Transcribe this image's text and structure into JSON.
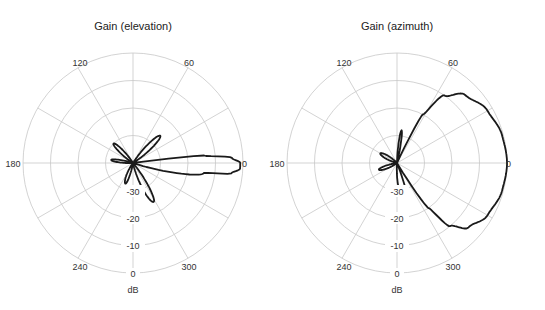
{
  "chart_data": [
    {
      "type": "polar-line",
      "title": "Gain (elevation)",
      "radial_label": "dB",
      "radial_ticks": [
        "-30",
        "-20",
        "-10",
        "0"
      ],
      "radial_range": [
        -40,
        0
      ],
      "angle_ticks": [
        "0",
        "60",
        "120",
        "180",
        "240",
        "300"
      ],
      "angle_spokes_deg": [
        0,
        30,
        60,
        90,
        120,
        150,
        180,
        210,
        240,
        270,
        300,
        330
      ],
      "grid": true,
      "series": [
        {
          "name": "elevation gain",
          "description": "Narrow main lobe at 0 deg (~-1 dB), side lobes near 45 deg, 135 deg, 170 deg, 250 deg and 295 deg at about -30 to -25 dB",
          "points_deg_db": [
            [
              0,
              -1
            ],
            [
              3,
              -4
            ],
            [
              6,
              -14
            ],
            [
              8,
              -40
            ],
            [
              30,
              -40
            ],
            [
              45,
              -26
            ],
            [
              60,
              -40
            ],
            [
              120,
              -40
            ],
            [
              135,
              -30
            ],
            [
              150,
              -40
            ],
            [
              160,
              -40
            ],
            [
              172,
              -32
            ],
            [
              185,
              -40
            ],
            [
              230,
              -40
            ],
            [
              250,
              -32
            ],
            [
              262,
              -40
            ],
            [
              280,
              -40
            ],
            [
              298,
              -24
            ],
            [
              312,
              -40
            ],
            [
              340,
              -40
            ],
            [
              352,
              -14
            ],
            [
              354,
              -4
            ],
            [
              357,
              -1
            ],
            [
              360,
              -1
            ]
          ]
        }
      ]
    },
    {
      "type": "polar-line",
      "title": "Gain (azimuth)",
      "radial_label": "dB",
      "radial_ticks": [
        "-30",
        "-20",
        "-10",
        "0"
      ],
      "radial_range": [
        -40,
        0
      ],
      "angle_ticks": [
        "0",
        "60",
        "120",
        "180",
        "240",
        "300"
      ],
      "angle_spokes_deg": [
        0,
        30,
        60,
        90,
        120,
        150,
        180,
        210,
        240,
        270,
        300,
        330
      ],
      "grid": true,
      "series": [
        {
          "name": "azimuth gain",
          "description": "Broad main lobe spanning roughly -60 to +65 deg with peak ~0 dB near 0 deg; small back lobes near 80, 150, 200 and 285 deg at about -30 dB",
          "points_deg_db": [
            [
              0,
              0
            ],
            [
              15,
              -0.5
            ],
            [
              30,
              -2
            ],
            [
              45,
              -5
            ],
            [
              55,
              -10
            ],
            [
              62,
              -20
            ],
            [
              66,
              -40
            ],
            [
              75,
              -40
            ],
            [
              82,
              -28
            ],
            [
              90,
              -40
            ],
            [
              130,
              -40
            ],
            [
              150,
              -33
            ],
            [
              170,
              -40
            ],
            [
              185,
              -40
            ],
            [
              200,
              -33
            ],
            [
              220,
              -40
            ],
            [
              265,
              -40
            ],
            [
              275,
              -31
            ],
            [
              288,
              -30
            ],
            [
              292,
              -40
            ],
            [
              300,
              -40
            ],
            [
              305,
              -20
            ],
            [
              310,
              -10
            ],
            [
              318,
              -5
            ],
            [
              330,
              -2
            ],
            [
              345,
              -0.5
            ],
            [
              360,
              0
            ]
          ]
        }
      ]
    }
  ]
}
